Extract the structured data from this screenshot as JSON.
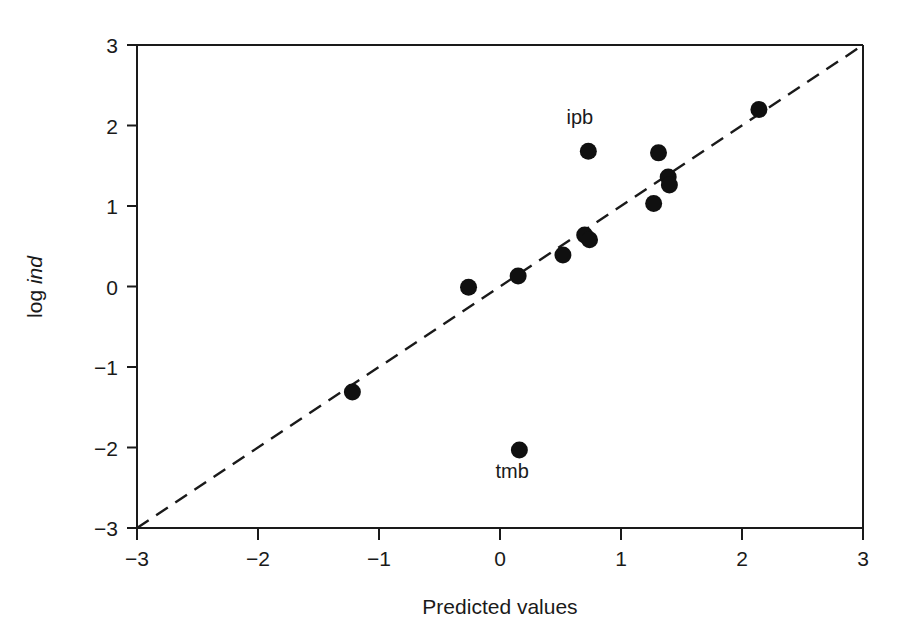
{
  "chart_data": {
    "type": "scatter",
    "title": "",
    "xlabel": "Predicted values",
    "ylabel": "log ind",
    "ylabel_parts": {
      "prefix": "log ",
      "italic": "ind"
    },
    "xlim": [
      -3,
      3
    ],
    "ylim": [
      -3,
      3
    ],
    "xticks": [
      -3,
      -2,
      -1,
      0,
      1,
      2,
      3
    ],
    "yticks": [
      -3,
      -2,
      -1,
      0,
      1,
      2,
      3
    ],
    "xticklabels": [
      "−3",
      "−2",
      "−1",
      "0",
      "1",
      "2",
      "3"
    ],
    "yticklabels": [
      "−3",
      "−2",
      "−1",
      "0",
      "1",
      "2",
      "3"
    ],
    "grid": false,
    "legend": false,
    "marker": "filled-circle",
    "marker_color": "#101010",
    "reference_line": {
      "style": "dashed",
      "description": "y = x identity line",
      "from": [
        -3,
        -3
      ],
      "to": [
        3,
        3
      ],
      "color": "#1a1a1a"
    },
    "points": [
      {
        "x": -1.22,
        "y": -1.31,
        "label": ""
      },
      {
        "x": -0.26,
        "y": -0.01,
        "label": ""
      },
      {
        "x": 0.15,
        "y": 0.13,
        "label": ""
      },
      {
        "x": 0.16,
        "y": -2.03,
        "label": "tmb",
        "label_position": "below"
      },
      {
        "x": 0.52,
        "y": 0.39,
        "label": ""
      },
      {
        "x": 0.7,
        "y": 0.64,
        "label": ""
      },
      {
        "x": 0.74,
        "y": 0.58,
        "label": ""
      },
      {
        "x": 0.73,
        "y": 1.68,
        "label": "ipb",
        "label_position": "above"
      },
      {
        "x": 1.27,
        "y": 1.03,
        "label": ""
      },
      {
        "x": 1.31,
        "y": 1.66,
        "label": ""
      },
      {
        "x": 1.39,
        "y": 1.36,
        "label": ""
      },
      {
        "x": 1.4,
        "y": 1.26,
        "label": ""
      },
      {
        "x": 2.14,
        "y": 2.2,
        "label": ""
      }
    ],
    "annotations": [
      {
        "text": "ipb",
        "x": 0.66,
        "y": 2.02
      },
      {
        "text": "tmb",
        "x": 0.1,
        "y": -2.38
      }
    ]
  },
  "figure": {
    "background": "#ffffff",
    "foreground": "#1a1a1a"
  }
}
